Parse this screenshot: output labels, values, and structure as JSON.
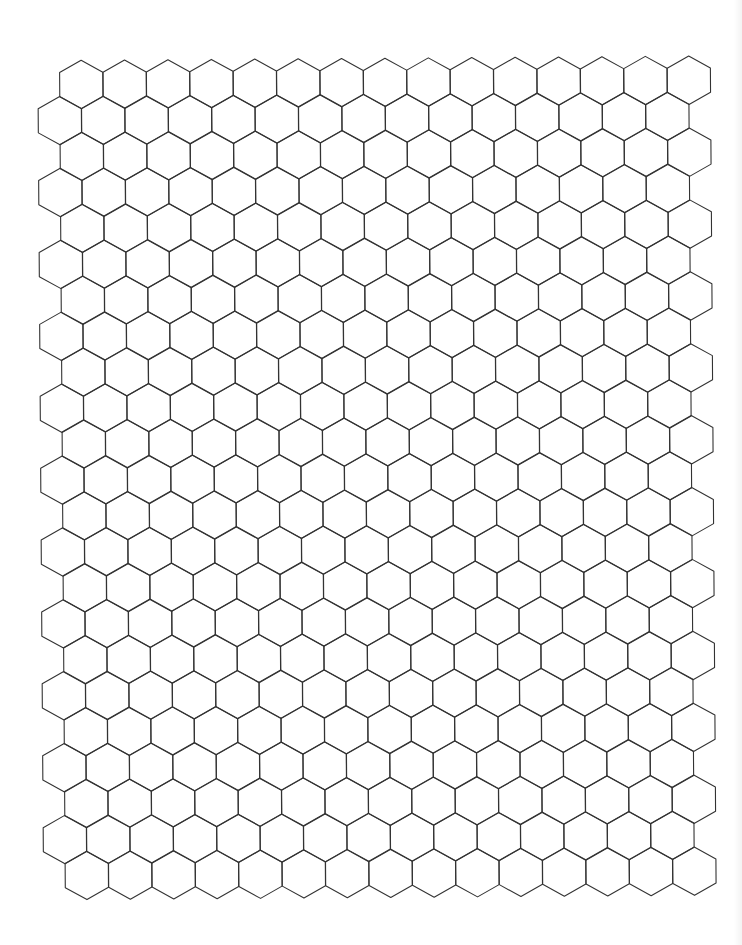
{
  "document": {
    "type": "hexagonal graph paper",
    "width": 742,
    "height": 945,
    "background": "#ffffff"
  },
  "grid": {
    "orientation": "pointy-top",
    "line_color": "#333333",
    "rows": 23,
    "columns_per_row": 15,
    "first_row_center_x": 84,
    "shifted_row_center_x": 62.3,
    "first_row_center_y": 82.5,
    "column_spacing": 43.4,
    "row_spacing": 35.95,
    "hex_half_width": 21.6,
    "hex_vertex_radius": 24.2,
    "rotation_deg": -0.4
  }
}
